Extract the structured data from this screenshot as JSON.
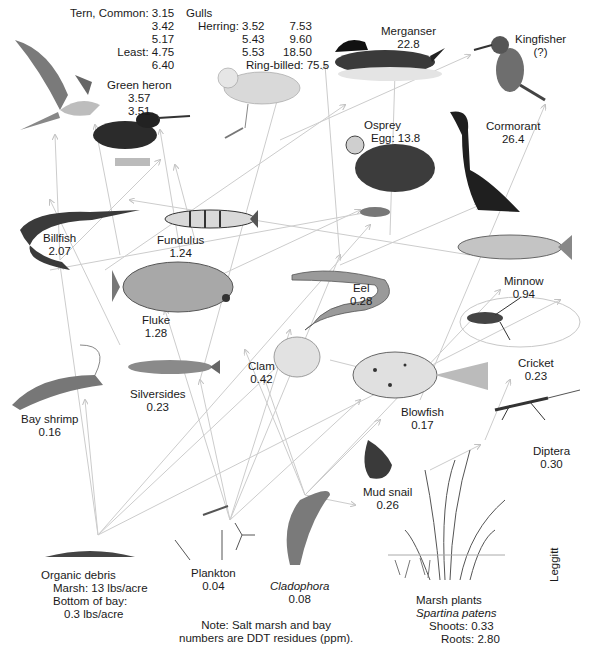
{
  "diagram": {
    "note_line1": "Note: Salt marsh and bay",
    "note_line2": "numbers are DDT residues (ppm).",
    "credit": "Leggitt",
    "colors": {
      "arrow": "#c8c8c8",
      "ink": "#1a1a1a",
      "illustration_dark": "#2b2b2b",
      "illustration_mid": "#8a8a8a",
      "illustration_light": "#d6d6d6"
    }
  },
  "tern": {
    "name": "Tern, Common:",
    "v1": "3.15",
    "v2": "3.42",
    "v3": "5.17",
    "least_label": "Least:",
    "v4": "4.75",
    "v5": "6.40"
  },
  "gulls": {
    "name": "Gulls",
    "herring_label": "Herring:",
    "col1": [
      "3.52",
      "5.43",
      "5.53"
    ],
    "col2": [
      "7.53",
      "9.60",
      "18.50"
    ],
    "ring_billed": "Ring-billed: 75.5"
  },
  "organisms": {
    "green_heron": {
      "name": "Green heron",
      "v1": "3.57",
      "v2": "3.51"
    },
    "merganser": {
      "name": "Merganser",
      "value": "22.8"
    },
    "kingfisher": {
      "name": "Kingfisher",
      "value": "(?)"
    },
    "osprey": {
      "name": "Osprey",
      "value": "Egg: 13.8"
    },
    "cormorant": {
      "name": "Cormorant",
      "value": "26.4"
    },
    "billfish": {
      "name": "Billfish",
      "value": "2.07"
    },
    "fundulus": {
      "name": "Fundulus",
      "value": "1.24"
    },
    "fluke": {
      "name": "Fluke",
      "value": "1.28"
    },
    "eel": {
      "name": "Eel",
      "value": "0.28"
    },
    "minnow": {
      "name": "Minnow",
      "value": "0.94"
    },
    "cricket": {
      "name": "Cricket",
      "value": "0.23"
    },
    "clam": {
      "name": "Clam",
      "value": "0.42"
    },
    "bay_shrimp": {
      "name": "Bay shrimp",
      "value": "0.16"
    },
    "silversides": {
      "name": "Silversides",
      "value": "0.23"
    },
    "blowfish": {
      "name": "Blowfish",
      "value": "0.17"
    },
    "diptera": {
      "name": "Diptera",
      "value": "0.30"
    },
    "mud_snail": {
      "name": "Mud snail",
      "value": "0.26"
    },
    "organic_debris": {
      "name": "Organic debris",
      "line2": "Marsh: 13 lbs/acre",
      "line3": "Bottom of bay:",
      "line4": "0.3 lbs/acre"
    },
    "plankton": {
      "name": "Plankton",
      "value": "0.04"
    },
    "cladophora": {
      "name": "Cladophora",
      "value": "0.08"
    },
    "marsh_plants": {
      "name": "Marsh plants",
      "species": "Spartina patens",
      "shoots": "Shoots: 0.33",
      "roots": "Roots: 2.80"
    }
  }
}
